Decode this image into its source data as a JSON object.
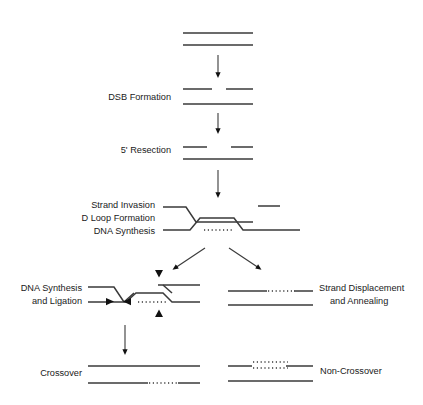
{
  "figure": {
    "line_color": "#3a3a3a",
    "text_color": "#1a1a1a",
    "background": "#ffffff"
  },
  "labels": {
    "dsb_formation": "DSB Formation",
    "resection": "5' Resection",
    "strand_invasion": "Strand Invasion",
    "d_loop_formation": "D Loop Formation",
    "dna_synthesis": "DNA Synthesis",
    "synthesis_ligation_1": "DNA Synthesis",
    "synthesis_ligation_2": "and Ligation",
    "strand_displacement_1": "Strand Displacement",
    "strand_displacement_2": "and Annealing",
    "crossover": "Crossover",
    "non_crossover": "Non-Crossover"
  },
  "steps": [
    {
      "id": "intact-duplex",
      "label": "",
      "y": 38
    },
    {
      "id": "dsb-formation",
      "label": "DSB Formation",
      "y": 96
    },
    {
      "id": "resection",
      "label": "5' Resection",
      "y": 150
    },
    {
      "id": "strand-invasion",
      "label": "Strand Invasion / D Loop Formation / DNA Synthesis",
      "y": 215
    },
    {
      "id": "synthesis-ligation",
      "label": "DNA Synthesis and Ligation",
      "y": 295
    },
    {
      "id": "strand-displacement",
      "label": "Strand Displacement and Annealing",
      "y": 295
    },
    {
      "id": "crossover",
      "label": "Crossover",
      "y": 372
    },
    {
      "id": "non-crossover",
      "label": "Non-Crossover",
      "y": 372
    }
  ]
}
